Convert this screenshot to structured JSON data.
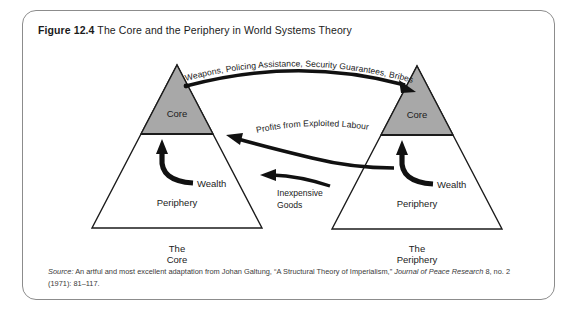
{
  "figure": {
    "number": "Figure 12.4",
    "title": " The Core and the Periphery in World Systems Theory"
  },
  "diagram": {
    "type": "conceptual-diagram",
    "left_triangle": {
      "core_label": "Core",
      "periphery_label": "Periphery",
      "caption_line1": "The",
      "caption_line2": "Core",
      "internal_arrow_label": "Wealth"
    },
    "right_triangle": {
      "core_label": "Core",
      "periphery_label": "Periphery",
      "caption_line1": "The",
      "caption_line2": "Periphery",
      "internal_arrow_label": "Wealth"
    },
    "flows": [
      {
        "id": "core-to-periphery-top",
        "label": "Weapons, Policing Assistance, Security Guarantees, Bribes",
        "direction": "left-core-to-right-core"
      },
      {
        "id": "profits",
        "label": "Profits from Exploited Labour",
        "direction": "right-to-left"
      },
      {
        "id": "goods",
        "label_line1": "Inexpensive",
        "label_line2": "Goods",
        "direction": "right-to-left"
      }
    ],
    "colors": {
      "core_fill": "#a8a8a8",
      "periphery_fill": "#ffffff",
      "outline": "#1b1b1b",
      "arrow": "#111111",
      "frame": "#8c8c8c"
    }
  },
  "source": {
    "label": "Source:",
    "text": " An artful and most excellent adaptation from Johan Galtung, “A Structural Theory of Imperialism,” ",
    "journal": "Journal of Peace Research",
    "citation": " 8, no. 2 (1971): 81–117."
  }
}
